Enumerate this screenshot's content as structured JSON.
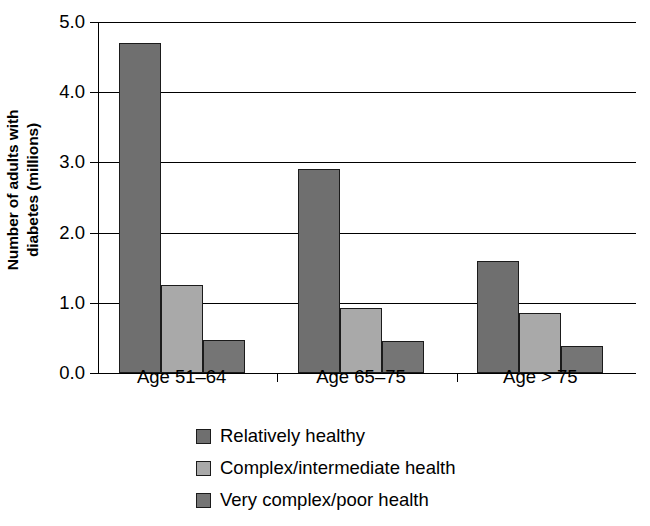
{
  "chart_data": {
    "type": "bar",
    "title": "",
    "subtitle": "",
    "xlabel": "",
    "ylabel": "Number of adults with diabetes (millions)",
    "ylabel_line1": "Number of adults with",
    "ylabel_line2": "diabetes (millions)",
    "categories": [
      "Age 51–64",
      "Age 65–75",
      "Age > 75"
    ],
    "series": [
      {
        "name": "Relatively healthy",
        "color": "#6f6f6f",
        "values": [
          4.7,
          2.9,
          1.6
        ]
      },
      {
        "name": "Complex/intermediate health",
        "color": "#a9a9a9",
        "values": [
          1.25,
          0.92,
          0.86
        ]
      },
      {
        "name": "Very complex/poor health",
        "color": "#757575",
        "values": [
          0.47,
          0.45,
          0.39
        ]
      }
    ],
    "ylim": [
      0.0,
      5.0
    ],
    "ytick_labels": [
      "5.0",
      "4.0",
      "3.0",
      "2.0",
      "1.0",
      "0.0"
    ],
    "ytick_values": [
      5.0,
      4.0,
      3.0,
      2.0,
      1.0,
      0.0
    ],
    "grid": true,
    "grid_axis": "y",
    "legend_position": "bottom",
    "legend": [
      "Relatively healthy",
      "Complex/intermediate health",
      "Very complex/poor health"
    ],
    "background_color": "#ffffff",
    "axis_color": "#000000"
  }
}
